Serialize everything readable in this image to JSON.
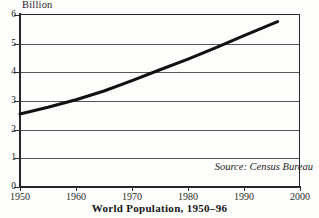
{
  "figure": {
    "caption": "World Population, 1950–96",
    "unit_label": "Billion",
    "source_note": "Source: Census Bureau",
    "frame_color": "#2a2a2a",
    "grid_color": "#555555",
    "line_color": "#111111",
    "background": "#fdfdfc"
  },
  "chart_data": {
    "type": "line",
    "title": "World Population, 1950–96",
    "subtitle": "",
    "xlabel": "",
    "ylabel": "Billion",
    "ylim": [
      0,
      6
    ],
    "xlim": [
      1950,
      2000
    ],
    "grid": "horizontal",
    "legend": "none",
    "annotations": [
      "Source: Census Bureau"
    ],
    "ytick_labels": [
      "0",
      "1",
      "2",
      "3",
      "4",
      "5",
      "6"
    ],
    "ytick_values": [
      0,
      1,
      2,
      3,
      4,
      5,
      6
    ],
    "xtick_labels": [
      "1950",
      "1960",
      "1970",
      "1980",
      "1990",
      "2000"
    ],
    "xtick_values": [
      1950,
      1960,
      1970,
      1980,
      1990,
      2000
    ],
    "series": [
      {
        "name": "World population",
        "units": "billion",
        "x": [
          1950,
          1955,
          1960,
          1965,
          1970,
          1975,
          1980,
          1985,
          1990,
          1996
        ],
        "values": [
          2.55,
          2.78,
          3.04,
          3.35,
          3.71,
          4.09,
          4.46,
          4.86,
          5.28,
          5.77
        ]
      }
    ]
  }
}
